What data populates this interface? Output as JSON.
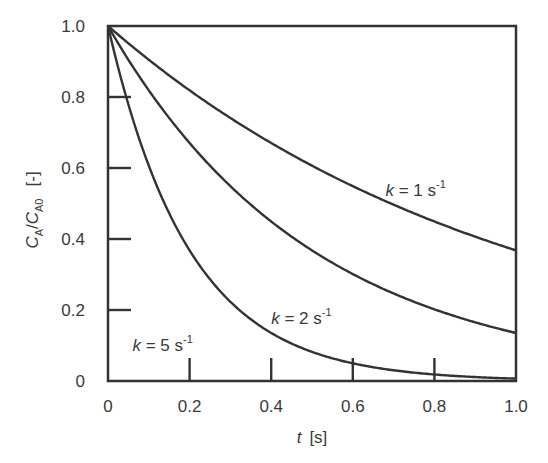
{
  "chart_data": {
    "type": "line",
    "title": "",
    "xlabel": "t  [s]",
    "xlabel_var": "t",
    "xlabel_unit": "[s]",
    "ylabel": "CA/CA0  [-]",
    "ylabel_parts": {
      "c1": "C",
      "s1": "A",
      "slash": "/",
      "c2": "C",
      "s2": "A0",
      "unit": "[-]"
    },
    "xlim": [
      0,
      1.0
    ],
    "ylim": [
      0,
      1.0
    ],
    "grid": false,
    "legend": "inline annotations",
    "x_ticks": [
      0,
      0.2,
      0.4,
      0.6,
      0.8,
      1.0
    ],
    "x_tick_labels": [
      "0",
      "0.2",
      "0.4",
      "0.6",
      "0.8",
      "1.0"
    ],
    "y_ticks": [
      0,
      0.2,
      0.4,
      0.6,
      0.8,
      1.0
    ],
    "y_tick_labels": [
      "0",
      "0.2",
      "0.4",
      "0.6",
      "0.8",
      "1.0"
    ],
    "x": [
      0,
      0.1,
      0.2,
      0.3,
      0.4,
      0.5,
      0.6,
      0.7,
      0.8,
      0.9,
      1.0
    ],
    "series": [
      {
        "name": "k = 1 s-1",
        "k": 1,
        "values": [
          1.0,
          0.905,
          0.819,
          0.741,
          0.67,
          0.607,
          0.549,
          0.497,
          0.449,
          0.407,
          0.368
        ]
      },
      {
        "name": "k = 2 s-1",
        "k": 2,
        "values": [
          1.0,
          0.819,
          0.67,
          0.549,
          0.449,
          0.368,
          0.301,
          0.247,
          0.202,
          0.165,
          0.135
        ]
      },
      {
        "name": "k = 5 s-1",
        "k": 5,
        "values": [
          1.0,
          0.607,
          0.368,
          0.223,
          0.135,
          0.082,
          0.05,
          0.03,
          0.018,
          0.011,
          0.007
        ]
      }
    ],
    "annotations": [
      {
        "var": "k",
        "text": " = 1 s",
        "sup": "-1",
        "x": 0.68,
        "y": 0.52
      },
      {
        "var": "k",
        "text": " = 2 s",
        "sup": "-1",
        "x": 0.4,
        "y": 0.16
      },
      {
        "var": "k",
        "text": " = 5 s",
        "sup": "-1",
        "x": 0.06,
        "y": 0.085
      }
    ]
  }
}
